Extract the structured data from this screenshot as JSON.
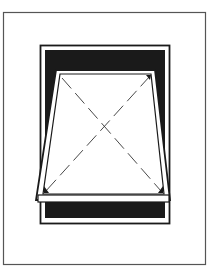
{
  "diagram": {
    "colors": {
      "background": "#ffffff",
      "line": "#222222",
      "fill_dark": "#1a1a1a",
      "border": "#555555"
    }
  }
}
